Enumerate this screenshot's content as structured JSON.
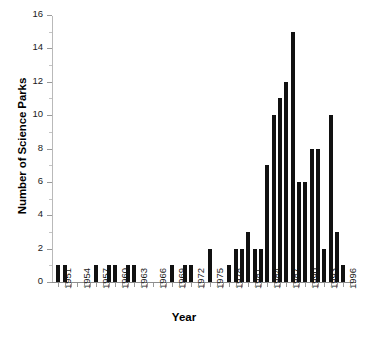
{
  "chart_data": {
    "type": "bar",
    "title": "",
    "xlabel": "Year",
    "ylabel": "Number of Science Parks",
    "ylim": [
      0,
      16
    ],
    "ytick_values": [
      0,
      2,
      4,
      6,
      8,
      10,
      12,
      14,
      16
    ],
    "ytick_labels": [
      "0",
      "2",
      "4",
      "6",
      "8",
      "10",
      "12",
      "14",
      "16"
    ],
    "xlim": [
      1950,
      1998
    ],
    "xtick_labels": [
      "1951",
      "1954",
      "1957",
      "1960",
      "1963",
      "1966",
      "1969",
      "1972",
      "1975",
      "1978",
      "1981",
      "1984",
      "1987",
      "1990",
      "1993",
      "1996"
    ],
    "grid": false,
    "legend": null,
    "bar_color": "#111111",
    "categories": [
      1951,
      1952,
      1953,
      1954,
      1955,
      1956,
      1957,
      1958,
      1959,
      1960,
      1961,
      1962,
      1963,
      1964,
      1965,
      1966,
      1967,
      1968,
      1969,
      1970,
      1971,
      1972,
      1973,
      1974,
      1975,
      1976,
      1977,
      1978,
      1979,
      1980,
      1981,
      1982,
      1983,
      1984,
      1985,
      1986,
      1987,
      1988,
      1989,
      1990,
      1991,
      1992,
      1993,
      1994,
      1995,
      1996,
      1997
    ],
    "values": [
      1,
      1,
      0,
      0,
      0,
      0,
      1,
      0,
      1,
      1,
      0,
      1,
      1,
      0,
      0,
      0,
      0,
      0,
      1,
      0,
      1,
      1,
      0,
      0,
      2,
      0,
      0,
      1,
      2,
      2,
      3,
      2,
      2,
      7,
      10,
      11,
      12,
      15,
      6,
      6,
      8,
      8,
      2,
      10,
      3,
      1,
      0
    ]
  },
  "axis": {
    "ylabel": "Number of Science Parks",
    "xlabel": "Year"
  },
  "caption": {
    "text": ""
  }
}
